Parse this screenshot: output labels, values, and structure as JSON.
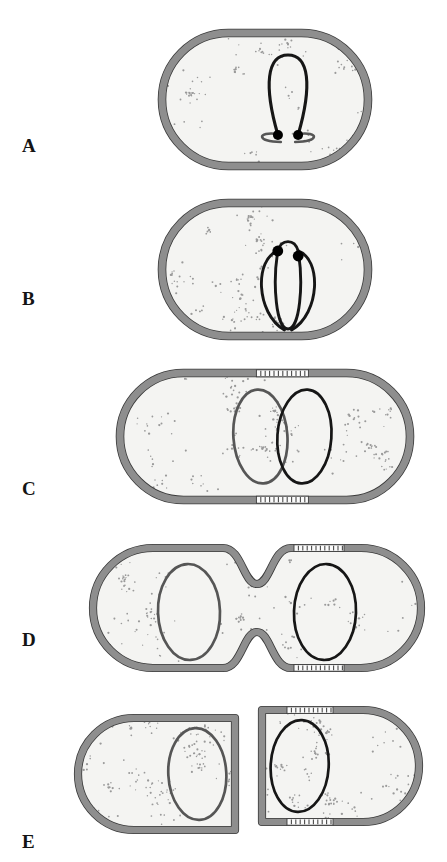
{
  "figure": {
    "width": 447,
    "height": 862,
    "background": "#ffffff"
  },
  "colors": {
    "background": "#ffffff",
    "cytoplasm": "#f4f4f2",
    "envelope_gray": "#8e8e8e",
    "envelope_gray_light": "#b9b9b9",
    "envelope_outline": "#3a3a3a",
    "new_wall_fill": "#fbfbfb",
    "new_wall_tick": "#4a4a4a",
    "chromosome_dark": "#161616",
    "chromosome_gray": "#565656",
    "fork_dot": "#000000",
    "ribosome_dot": "#9a9a9a",
    "label_text": "#141414"
  },
  "panels": [
    {
      "id": "A",
      "label": "A",
      "label_x": 22,
      "label_y": 136,
      "caption": "Chromosome replication initiates; two replication forks sit together at the membrane attachment site",
      "cell": {
        "x": 162,
        "y": 33,
        "width": 206,
        "height": 133,
        "shape": "stadium"
      },
      "chromosome": {
        "style": "narrow-loop",
        "fork_count": 2,
        "color": "chromosome_dark"
      },
      "new_wall_bands": 0
    },
    {
      "id": "B",
      "label": "B",
      "label_x": 22,
      "label_y": 289,
      "caption": "Replication in progress; forks have moved apart producing a theta-shaped intermediate",
      "cell": {
        "x": 162,
        "y": 203,
        "width": 206,
        "height": 133,
        "shape": "stadium"
      },
      "chromosome": {
        "style": "theta",
        "fork_count": 2,
        "color": "chromosome_dark"
      },
      "new_wall_bands": 0
    },
    {
      "id": "C",
      "label": "C",
      "label_x": 22,
      "label_y": 479,
      "caption": "Replication complete; two daughter chromosomes separate as new wall material is inserted at midcell",
      "cell": {
        "x": 120,
        "y": 373,
        "width": 290,
        "height": 127,
        "shape": "stadium"
      },
      "chromosome": {
        "style": "two-overlapping-ovals",
        "fork_count": 0,
        "color": "chromosome_dark"
      },
      "new_wall_bands": 2
    },
    {
      "id": "D",
      "label": "D",
      "label_x": 22,
      "label_y": 630,
      "caption": "Septum formation; the envelope constricts at midcell between the segregated chromosomes",
      "cell": {
        "x": 93,
        "y": 548,
        "width": 328,
        "height": 120,
        "shape": "constricted"
      },
      "chromosome": {
        "style": "two-separated-ovals",
        "fork_count": 0,
        "color": "chromosome_dark"
      },
      "new_wall_bands": 2
    },
    {
      "id": "E",
      "label": "E",
      "label_x": 22,
      "label_y": 832,
      "caption": "Division complete; two daughter cells each with one chromosome and one new flat pole",
      "cells": [
        {
          "x": 78,
          "y": 718,
          "width": 157,
          "height": 112,
          "flat_pole": "right"
        },
        {
          "x": 262,
          "y": 710,
          "width": 157,
          "height": 112,
          "flat_pole": "left"
        }
      ],
      "chromosome": {
        "style": "single-oval",
        "fork_count": 0,
        "color": "chromosome_dark"
      },
      "new_wall_bands": 2
    }
  ],
  "legend_elements": {
    "envelope": "cell envelope / wall",
    "new_wall": "newly synthesized wall material",
    "chromosome": "chromosome",
    "fork": "replication fork",
    "ribosomes": "cytoplasmic ribosomes (stipple)"
  }
}
